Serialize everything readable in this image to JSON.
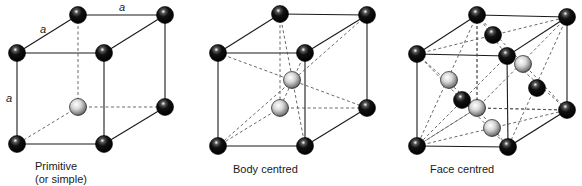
{
  "figure": {
    "colors": {
      "edge": "#1a1a1a",
      "dashed": "#444444",
      "atom_front": "#111111",
      "atom_back": "#cfcfcf",
      "highlight": "#ffffff"
    },
    "cells": [
      {
        "id": "primitive",
        "caption_line1": "Primitive",
        "caption_line2": "(or simple)",
        "caption_pos": [
          35,
          160
        ],
        "corners": {
          "btl": [
            78,
            15
          ],
          "btr": [
            165,
            15
          ],
          "bbl": [
            78,
            107
          ],
          "bbr": [
            165,
            107
          ],
          "ftl": [
            17,
            53
          ],
          "ftr": [
            104,
            53
          ],
          "fbl": [
            17,
            144
          ],
          "fbr": [
            104,
            144
          ]
        },
        "hidden_corner": "bbl",
        "extra_atoms": [],
        "dashed_lines": [],
        "edge_labels": [
          {
            "text": "a",
            "pos": [
              119,
              2
            ]
          },
          {
            "text": "a",
            "pos": [
              40,
              24
            ]
          },
          {
            "text": "a",
            "pos": [
              6,
              93
            ]
          }
        ]
      },
      {
        "id": "body-centred",
        "caption_line1": "Body centred",
        "caption_line2": "",
        "caption_pos": [
          233,
          163
        ],
        "corners": {
          "btl": [
            280,
            14
          ],
          "btr": [
            367,
            15
          ],
          "bbl": [
            280,
            108
          ],
          "bbr": [
            367,
            108
          ],
          "ftl": [
            218,
            53
          ],
          "ftr": [
            305,
            53
          ],
          "fbl": [
            218,
            146
          ],
          "fbr": [
            305,
            146
          ]
        },
        "hidden_corner": "bbl",
        "extra_atoms": [
          {
            "name": "body-centre-atom",
            "pos": [
              292,
              80
            ],
            "shade": "back"
          }
        ],
        "dashed_lines": [
          [
            [
              218,
              53
            ],
            [
              367,
              108
            ]
          ],
          [
            [
              305,
              53
            ],
            [
              280,
              108
            ]
          ],
          [
            [
              280,
              14
            ],
            [
              305,
              146
            ]
          ],
          [
            [
              367,
              15
            ],
            [
              218,
              146
            ]
          ]
        ],
        "edge_labels": []
      },
      {
        "id": "face-centred",
        "caption_line1": "Face centred",
        "caption_line2": "",
        "caption_pos": [
          430,
          163
        ],
        "corners": {
          "btl": [
            477,
            15
          ],
          "btr": [
            567,
            17
          ],
          "bbl": [
            477,
            108
          ],
          "bbr": [
            567,
            110
          ],
          "ftl": [
            417,
            54
          ],
          "ftr": [
            507,
            56
          ],
          "fbl": [
            417,
            146
          ],
          "fbr": [
            508,
            147
          ]
        },
        "hidden_corner": "bbl",
        "extra_atoms": [
          {
            "name": "top-face-centre-atom",
            "pos": [
              493,
              35
            ],
            "shade": "front"
          },
          {
            "name": "back-face-centre-atom",
            "pos": [
              523,
              64
            ],
            "shade": "back"
          },
          {
            "name": "left-face-centre-atom",
            "pos": [
              449,
              80
            ],
            "shade": "back"
          },
          {
            "name": "right-face-centre-atom",
            "pos": [
              537,
              88
            ],
            "shade": "front"
          },
          {
            "name": "front-face-centre-atom",
            "pos": [
              462,
              100
            ],
            "shade": "front"
          },
          {
            "name": "bottom-face-centre-atom",
            "pos": [
              492,
              128
            ],
            "shade": "back"
          }
        ],
        "dashed_lines": [
          [
            [
              417,
              54
            ],
            [
              567,
              17
            ]
          ],
          [
            [
              477,
              15
            ],
            [
              507,
              56
            ]
          ],
          [
            [
              477,
              15
            ],
            [
              567,
              110
            ]
          ],
          [
            [
              567,
              17
            ],
            [
              477,
              108
            ]
          ],
          [
            [
              417,
              54
            ],
            [
              477,
              108
            ]
          ],
          [
            [
              477,
              15
            ],
            [
              417,
              146
            ]
          ],
          [
            [
              567,
              17
            ],
            [
              508,
              147
            ]
          ],
          [
            [
              507,
              56
            ],
            [
              567,
              110
            ]
          ],
          [
            [
              417,
              54
            ],
            [
              508,
              147
            ]
          ],
          [
            [
              507,
              56
            ],
            [
              417,
              146
            ]
          ],
          [
            [
              417,
              146
            ],
            [
              567,
              110
            ]
          ],
          [
            [
              477,
              108
            ],
            [
              508,
              147
            ]
          ],
          [
            [
              477,
              108
            ],
            [
              567,
              110
            ]
          ],
          [
            [
              477,
              15
            ],
            [
              477,
              108
            ]
          ],
          [
            [
              417,
              146
            ],
            [
              477,
              108
            ]
          ]
        ],
        "edge_labels": []
      }
    ]
  }
}
